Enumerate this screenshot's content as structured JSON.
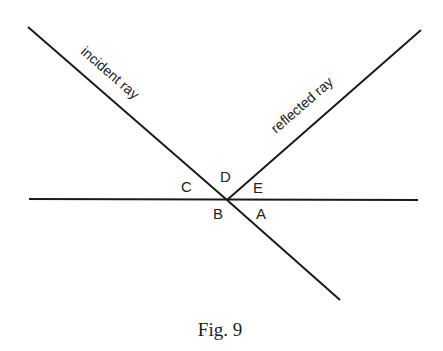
{
  "diagram": {
    "type": "reflection-of-light",
    "lines": {
      "surface": {
        "x1": 29,
        "y1": 199,
        "x2": 418,
        "y2": 200
      },
      "incident_ray": {
        "x1": 28,
        "y1": 27,
        "x2": 227,
        "y2": 200
      },
      "incident_extension": {
        "x1": 227,
        "y1": 200,
        "x2": 340,
        "y2": 300
      },
      "reflected_ray": {
        "x1": 227,
        "y1": 200,
        "x2": 421,
        "y2": 30
      }
    },
    "ray_labels": {
      "incident": "incident ray",
      "reflected": "reflected ray"
    },
    "angle_labels": {
      "A": "A",
      "B": "B",
      "C": "C",
      "D": "D",
      "E": "E"
    },
    "caption": "Fig. 9",
    "line_color": "#1a1a1a"
  }
}
